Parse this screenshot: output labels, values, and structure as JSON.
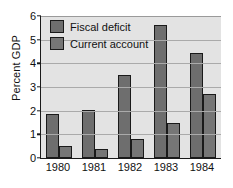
{
  "chart_data": {
    "type": "bar",
    "title": "",
    "xlabel": "",
    "ylabel": "Percent GDP",
    "categories": [
      "1980",
      "1981",
      "1982",
      "1983",
      "1984"
    ],
    "series": [
      {
        "name": "Fiscal deficit",
        "color": "#6e6e6e",
        "values": [
          1.85,
          2.03,
          3.5,
          5.6,
          4.45
        ]
      },
      {
        "name": "Current account",
        "color": "#767676",
        "values": [
          0.5,
          0.4,
          0.8,
          1.5,
          2.7
        ]
      }
    ],
    "ylim": [
      0,
      6
    ],
    "yticks": [
      0,
      1,
      2,
      3,
      4,
      5,
      6
    ],
    "ytick_labels": [
      "0",
      "1",
      "2",
      "3",
      "4",
      "5",
      "6"
    ],
    "grid": true,
    "grid_axis": "y",
    "legend_position": "upper-left-inside",
    "plot_background": "#e3e3e3",
    "figure_background": "#ffffff",
    "axis_color": "#1a1a1a",
    "grid_color": "#aaaaaa"
  }
}
